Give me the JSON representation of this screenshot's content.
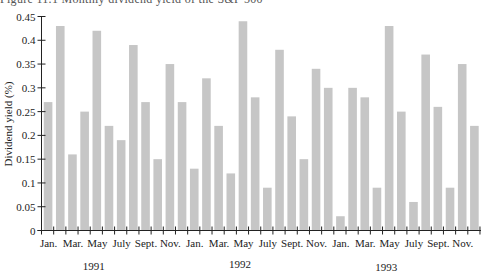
{
  "chart_data": {
    "type": "bar",
    "title": "Figure 11.1 Monthly dividend yield of the S&P 500",
    "xlabel": "",
    "ylabel": "Dividend yield (%)",
    "ylim": [
      0,
      0.45
    ],
    "yticks": [
      "0",
      "0.05",
      "0.1",
      "0.15",
      "0.2",
      "0.25",
      "0.3",
      "0.35",
      "0.4",
      "0.45"
    ],
    "categories": [
      "Jan. 1991",
      "Feb. 1991",
      "Mar. 1991",
      "Apr. 1991",
      "May 1991",
      "June 1991",
      "July 1991",
      "Aug. 1991",
      "Sept. 1991",
      "Oct. 1991",
      "Nov. 1991",
      "Dec. 1991",
      "Jan. 1992",
      "Feb. 1992",
      "Mar. 1992",
      "Apr. 1992",
      "May 1992",
      "June 1992",
      "July 1992",
      "Aug. 1992",
      "Sept. 1992",
      "Oct. 1992",
      "Nov. 1992",
      "Dec. 1992",
      "Jan. 1993",
      "Feb. 1993",
      "Mar. 1993",
      "Apr. 1993",
      "May 1993",
      "June 1993",
      "July 1993",
      "Aug. 1993",
      "Sept. 1993",
      "Oct. 1993",
      "Nov. 1993",
      "Dec. 1993"
    ],
    "values": [
      0.27,
      0.43,
      0.16,
      0.25,
      0.42,
      0.22,
      0.19,
      0.39,
      0.27,
      0.15,
      0.35,
      0.27,
      0.13,
      0.32,
      0.22,
      0.12,
      0.44,
      0.28,
      0.09,
      0.38,
      0.24,
      0.15,
      0.34,
      0.3,
      0.03,
      0.3,
      0.28,
      0.09,
      0.43,
      0.25,
      0.06,
      0.37,
      0.26,
      0.09,
      0.35,
      0.22
    ],
    "xtick_labels": [
      "Jan.",
      "Mar.",
      "May",
      "July",
      "Sept.",
      "Nov.",
      "Jan.",
      "Mar.",
      "May",
      "July",
      "Sept.",
      "Nov.",
      "Jan.",
      "Mar.",
      "May",
      "July",
      "Sept.",
      "Nov."
    ],
    "xtick_label_every": 2,
    "year_labels": [
      "1991",
      "1992",
      "1993"
    ],
    "bar_color": "#c6c6c6",
    "axis_color": "#222222",
    "grid": false,
    "legend": "none"
  }
}
